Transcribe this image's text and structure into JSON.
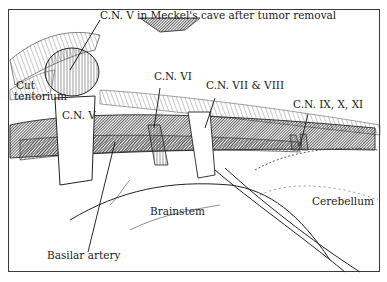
{
  "figure": {
    "type": "anatomical line illustration",
    "ink_color": "#1a1a1a",
    "background": "#ffffff",
    "labels": {
      "cn5_meckel": "C.N. V in Meckel's cave after tumor removal",
      "cut_tentorium_1": "Cut",
      "cut_tentorium_2": "tentorium",
      "cn5": "C.N. V",
      "cn6": "C.N. VI",
      "cn7_8": "C.N. VII & VIII",
      "cn9_10_11": "C.N. IX, X, XI",
      "brainstem": "Brainstem",
      "cerebellum": "Cerebellum",
      "basilar_artery": "Basilar artery"
    }
  }
}
